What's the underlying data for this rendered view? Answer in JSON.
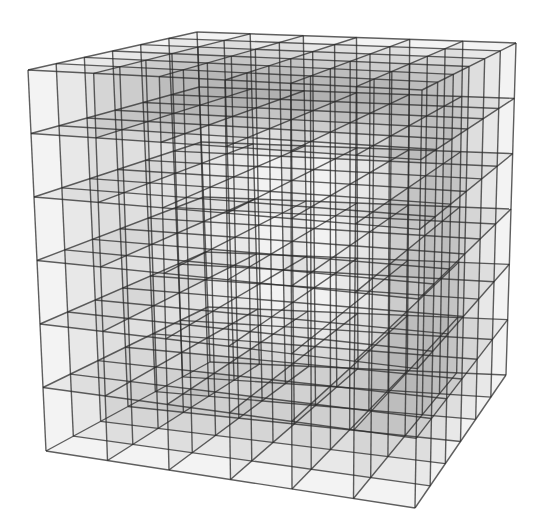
{
  "figure": {
    "grid": {
      "nx": 6,
      "ny": 6,
      "nz": 6
    },
    "corners": {
      "FBL": [
        46,
        451
      ],
      "FBR": [
        415,
        508
      ],
      "FTL": [
        28,
        70
      ],
      "FTR": [
        422,
        90
      ],
      "BBL": [
        210,
        362
      ],
      "BBR": [
        506,
        375
      ],
      "BTL": [
        197,
        32
      ],
      "BTR": [
        516,
        43
      ]
    },
    "colors": {
      "background": "#ffffff",
      "edge": "#2b2b2b",
      "shell_fill": "#7a7a7a",
      "inner_fill": "#e9e9e9"
    },
    "label": "Cube lattice"
  }
}
